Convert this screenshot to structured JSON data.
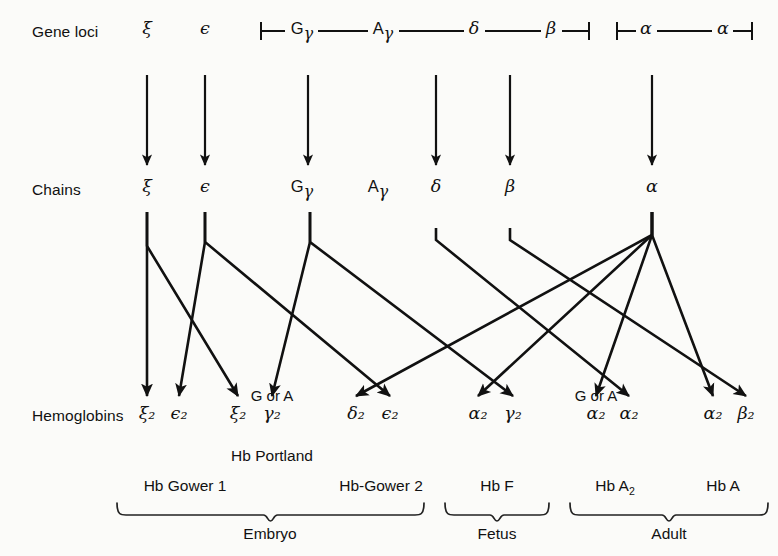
{
  "figure": {
    "background": "#fbfbf9",
    "ink": "#111111",
    "width": 778,
    "height": 556
  },
  "rows": {
    "gene_loci_label": "Gene loci",
    "chains_label": "Chains",
    "hemoglobins_label": "Hemoglobins"
  },
  "gene_loci": [
    {
      "name": "zeta-locus",
      "text": "ξ",
      "x": 147,
      "y": 31,
      "style": "greek"
    },
    {
      "name": "epsilon-locus",
      "text": "ϵ",
      "x": 205,
      "y": 31,
      "style": "greek"
    },
    {
      "name": "g-gamma-locus",
      "prefix": "G",
      "text": "γ",
      "x": 302,
      "y": 31,
      "style": "greek-sub"
    },
    {
      "name": "a-gamma-locus",
      "prefix": "A",
      "text": "γ",
      "x": 383,
      "y": 31,
      "style": "greek-sub"
    },
    {
      "name": "delta-locus",
      "text": "δ",
      "x": 474,
      "y": 31,
      "style": "greek"
    },
    {
      "name": "beta-locus",
      "text": "β",
      "x": 551,
      "y": 31,
      "style": "greek"
    },
    {
      "name": "alpha-locus-1",
      "text": "α",
      "x": 646,
      "y": 31,
      "style": "greek"
    },
    {
      "name": "alpha-locus-2",
      "text": "α",
      "x": 723,
      "y": 31,
      "style": "greek"
    }
  ],
  "chains": [
    {
      "name": "zeta-chain",
      "text": "ξ",
      "x": 147,
      "y": 189,
      "style": "greek"
    },
    {
      "name": "epsilon-chain",
      "text": "ϵ",
      "x": 205,
      "y": 189,
      "style": "greek"
    },
    {
      "name": "g-gamma-chain",
      "prefix": "G",
      "text": "γ",
      "x": 302,
      "y": 189,
      "style": "greek-sub"
    },
    {
      "name": "a-gamma-chain",
      "prefix": "A",
      "text": "γ",
      "x": 378,
      "y": 189,
      "style": "greek-sub"
    },
    {
      "name": "delta-chain",
      "text": "δ",
      "x": 436,
      "y": 189,
      "style": "greek"
    },
    {
      "name": "beta-chain",
      "text": "β",
      "x": 510,
      "y": 189,
      "style": "greek"
    },
    {
      "name": "alpha-chain",
      "text": "α",
      "x": 652,
      "y": 189,
      "style": "greek"
    }
  ],
  "hemoglobin_subunits": [
    {
      "name": "hb-subunit-zeta2-a",
      "text": "ξ₂",
      "x": 147,
      "y": 416
    },
    {
      "name": "hb-subunit-epsilon2-a",
      "text": "ϵ₂",
      "x": 179,
      "y": 416
    },
    {
      "name": "hb-subunit-zeta2-b",
      "text": "ξ₂",
      "x": 238,
      "y": 416
    },
    {
      "name": "hb-subunit-gamma2-a",
      "text": "γ₂",
      "x": 272,
      "y": 416
    },
    {
      "name": "hb-subunit-delta2",
      "text": "δ₂",
      "x": 356,
      "y": 416
    },
    {
      "name": "hb-subunit-epsilon2-b",
      "text": "ϵ₂",
      "x": 390,
      "y": 416
    },
    {
      "name": "hb-subunit-alpha2-a",
      "text": "α₂",
      "x": 478,
      "y": 416
    },
    {
      "name": "hb-subunit-gamma2-b",
      "text": "γ₂",
      "x": 513,
      "y": 416
    },
    {
      "name": "hb-subunit-alpha2-b",
      "text": "α₂",
      "x": 596,
      "y": 416
    },
    {
      "name": "hb-subunit-alpha2-c",
      "text": "α₂",
      "x": 629,
      "y": 416
    },
    {
      "name": "hb-subunit-alpha2-d",
      "text": "α₂",
      "x": 713,
      "y": 416
    },
    {
      "name": "hb-subunit-beta2",
      "text": "β₂",
      "x": 746,
      "y": 416
    }
  ],
  "g_or_a_notes": [
    {
      "name": "g-or-a-note-left",
      "text": "G or A",
      "x": 272,
      "y": 396
    },
    {
      "name": "g-or-a-note-right",
      "text": "G or A",
      "x": 596,
      "y": 396
    }
  ],
  "hb_names": [
    {
      "name": "hb-portland",
      "text": "Hb Portland",
      "x": 272,
      "y": 457
    },
    {
      "name": "hb-gower-1",
      "text": "Hb Gower 1",
      "x": 185,
      "y": 487
    },
    {
      "name": "hb-gower-2",
      "text": "Hb-Gower 2",
      "x": 381,
      "y": 487
    },
    {
      "name": "hb-f",
      "text": "Hb F",
      "x": 497,
      "y": 487
    },
    {
      "name": "hb-a2",
      "text": "Hb A",
      "sub": "2",
      "x": 615,
      "y": 487
    },
    {
      "name": "hb-a",
      "text": "Hb A",
      "x": 723,
      "y": 487
    }
  ],
  "stages": [
    {
      "name": "stage-embryo",
      "text": "Embryo",
      "x": 270,
      "y": 535,
      "brace_left": 117,
      "brace_right": 424
    },
    {
      "name": "stage-fetus",
      "text": "Fetus",
      "x": 497,
      "y": 535,
      "brace_left": 445,
      "brace_right": 549
    },
    {
      "name": "stage-adult",
      "text": "Adult",
      "x": 669,
      "y": 535,
      "brace_left": 570,
      "brace_right": 768
    }
  ],
  "locus_brackets": [
    {
      "name": "bracket-beta-cluster",
      "left": 261,
      "right": 589,
      "y": 31
    },
    {
      "name": "bracket-alpha-cluster",
      "left": 617,
      "right": 752,
      "y": 31
    }
  ],
  "locus_connectors": [
    {
      "name": "connector-ggamma-agamma",
      "x1": 318,
      "x2": 368,
      "y": 31
    },
    {
      "name": "connector-agamma-delta",
      "x1": 399,
      "x2": 464,
      "y": 31
    },
    {
      "name": "connector-delta-beta",
      "x1": 485,
      "x2": 541,
      "y": 31
    },
    {
      "name": "connector-alpha-alpha",
      "x1": 657,
      "x2": 712,
      "y": 31
    }
  ],
  "transcription_arrows": [
    {
      "name": "arrow-locus-to-chain-zeta",
      "x": 147,
      "y1": 75,
      "y2": 165
    },
    {
      "name": "arrow-locus-to-chain-epsilon",
      "x": 205,
      "y1": 75,
      "y2": 165
    },
    {
      "name": "arrow-locus-to-chain-gamma",
      "x": 308,
      "y1": 75,
      "y2": 165
    },
    {
      "name": "arrow-locus-to-chain-delta",
      "x": 436,
      "y1": 75,
      "y2": 165
    },
    {
      "name": "arrow-locus-to-chain-beta",
      "x": 510,
      "y1": 75,
      "y2": 165
    },
    {
      "name": "arrow-locus-to-chain-alpha",
      "x": 652,
      "y1": 75,
      "y2": 165
    }
  ],
  "assembly_paths": [
    {
      "name": "path-zeta-to-zeta2-gower1",
      "stem_x": 147,
      "stem_y1": 212,
      "elbow_y": 246,
      "end_x": 147,
      "end_y": 396
    },
    {
      "name": "path-zeta-to-zeta2-portland",
      "stem_x": 147,
      "stem_y1": 212,
      "elbow_y": 246,
      "end_x": 238,
      "end_y": 396
    },
    {
      "name": "path-epsilon-to-epsilon2-gower1",
      "stem_x": 205,
      "stem_y1": 212,
      "elbow_y": 242,
      "end_x": 179,
      "end_y": 396
    },
    {
      "name": "path-epsilon-to-epsilon2-gower2",
      "stem_x": 205,
      "stem_y1": 212,
      "elbow_y": 242,
      "end_x": 390,
      "end_y": 396
    },
    {
      "name": "path-ggamma-to-gamma2-portland",
      "stem_x": 310,
      "stem_y1": 212,
      "elbow_y": 242,
      "end_x": 272,
      "end_y": 396
    },
    {
      "name": "path-ggamma-to-gamma2-hbf",
      "stem_x": 310,
      "stem_y1": 212,
      "elbow_y": 242,
      "end_x": 513,
      "end_y": 396
    },
    {
      "name": "path-delta-to-delta2",
      "stem_x": 436,
      "stem_y1": 228,
      "elbow_y": 240,
      "end_x": 629,
      "end_y": 396
    },
    {
      "name": "path-beta-to-beta2",
      "stem_x": 510,
      "stem_y1": 228,
      "elbow_y": 240,
      "end_x": 746,
      "end_y": 396
    },
    {
      "name": "path-alpha-to-epsilon2-gower2",
      "stem_x": 652,
      "stem_y1": 212,
      "elbow_y": 235,
      "end_x": 356,
      "end_y": 396
    },
    {
      "name": "path-alpha-to-alpha2-hbf",
      "stem_x": 652,
      "stem_y1": 212,
      "elbow_y": 235,
      "end_x": 478,
      "end_y": 396
    },
    {
      "name": "path-alpha-to-alpha2-hba2",
      "stem_x": 652,
      "stem_y1": 212,
      "elbow_y": 235,
      "end_x": 596,
      "end_y": 396
    },
    {
      "name": "path-alpha-to-alpha2-hba",
      "stem_x": 652,
      "stem_y1": 212,
      "elbow_y": 235,
      "end_x": 713,
      "end_y": 396
    }
  ]
}
